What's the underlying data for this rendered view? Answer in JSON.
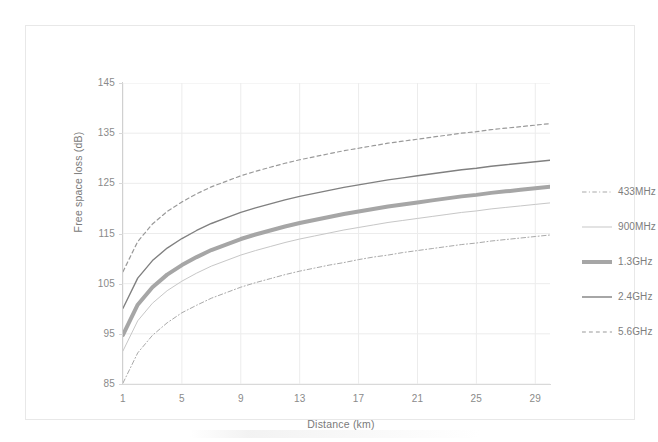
{
  "chart_data": {
    "type": "line",
    "title": "",
    "xlabel": "Distance (km)",
    "ylabel": "Free space loss (dB)",
    "xlim": [
      1,
      30
    ],
    "ylim": [
      85,
      145
    ],
    "xticks": [
      1,
      5,
      9,
      13,
      17,
      21,
      25,
      29
    ],
    "yticks": [
      85,
      95,
      105,
      115,
      125,
      135,
      145
    ],
    "grid": true,
    "legend_position": "right",
    "x": [
      1,
      2,
      3,
      4,
      5,
      6,
      7,
      8,
      9,
      10,
      11,
      12,
      13,
      14,
      15,
      16,
      17,
      18,
      19,
      20,
      21,
      22,
      23,
      24,
      25,
      26,
      27,
      28,
      29,
      30
    ],
    "series": [
      {
        "name": "433MHz",
        "style": "dash-dot",
        "color": "#a9a9a9",
        "width": 1,
        "values": [
          85.2,
          91.2,
          94.7,
          97.2,
          99.2,
          100.7,
          102.1,
          103.2,
          104.3,
          105.2,
          106.0,
          106.8,
          107.5,
          108.1,
          108.7,
          109.2,
          109.8,
          110.3,
          110.7,
          111.2,
          111.6,
          112.0,
          112.4,
          112.8,
          113.1,
          113.5,
          113.8,
          114.1,
          114.4,
          114.7
        ]
      },
      {
        "name": "900MHz",
        "style": "solid",
        "color": "#c7c7c7",
        "width": 1,
        "values": [
          91.6,
          97.6,
          101.1,
          103.6,
          105.5,
          107.1,
          108.5,
          109.6,
          110.7,
          111.6,
          112.4,
          113.2,
          113.9,
          114.5,
          115.1,
          115.7,
          116.2,
          116.7,
          117.2,
          117.6,
          118.0,
          118.4,
          118.8,
          119.2,
          119.5,
          119.9,
          120.2,
          120.5,
          120.8,
          121.1
        ]
      },
      {
        "name": "1.3GHz",
        "style": "solid",
        "color": "#a6a6a6",
        "width": 4,
        "values": [
          94.8,
          100.8,
          104.3,
          106.8,
          108.7,
          110.3,
          111.7,
          112.8,
          113.9,
          114.8,
          115.6,
          116.4,
          117.1,
          117.7,
          118.3,
          118.9,
          119.4,
          119.9,
          120.4,
          120.8,
          121.2,
          121.6,
          122.0,
          122.4,
          122.7,
          123.1,
          123.4,
          123.7,
          124.0,
          124.3
        ]
      },
      {
        "name": "2.4GHz",
        "style": "solid",
        "color": "#808080",
        "width": 1.4,
        "values": [
          100.1,
          106.1,
          109.6,
          112.1,
          114.0,
          115.6,
          117.0,
          118.1,
          119.2,
          120.1,
          120.9,
          121.7,
          122.4,
          123.0,
          123.6,
          124.2,
          124.7,
          125.2,
          125.7,
          126.1,
          126.5,
          126.9,
          127.3,
          127.7,
          128.0,
          128.4,
          128.7,
          129.0,
          129.3,
          129.6
        ]
      },
      {
        "name": "5.6GHz",
        "style": "dashed",
        "color": "#9a9a9a",
        "width": 1.2,
        "values": [
          107.4,
          113.4,
          116.9,
          119.4,
          121.3,
          122.9,
          124.3,
          125.4,
          126.5,
          127.4,
          128.2,
          129.0,
          129.7,
          130.3,
          130.9,
          131.5,
          132.0,
          132.5,
          133.0,
          133.4,
          133.8,
          134.2,
          134.6,
          135.0,
          135.3,
          135.7,
          136.0,
          136.3,
          136.6,
          136.9
        ]
      }
    ]
  },
  "legend": {
    "items": [
      {
        "label": "433MHz"
      },
      {
        "label": "900MHz"
      },
      {
        "label": "1.3GHz"
      },
      {
        "label": "2.4GHz"
      },
      {
        "label": "5.6GHz"
      }
    ]
  }
}
